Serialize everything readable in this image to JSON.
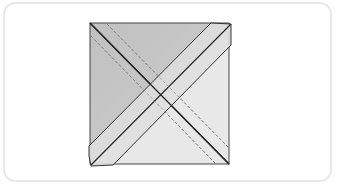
{
  "diagram": {
    "type": "folded-square-illustration",
    "colors": {
      "dark_region": "#c4c4c4",
      "light_region": "#e6e6e6",
      "strip": "#dcdcdc",
      "outline": "#333333",
      "dashed": "#8a8a8a",
      "card_border": "#e9e9e9"
    }
  }
}
